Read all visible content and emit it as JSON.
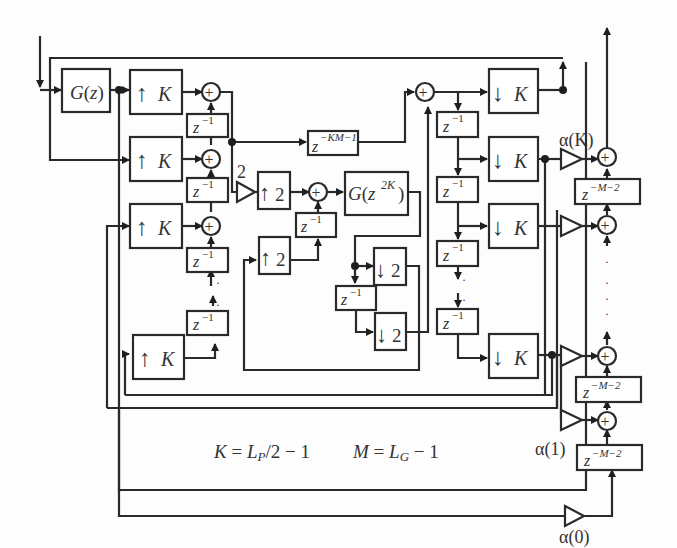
{
  "diagram": {
    "type": "signal-flow block diagram",
    "blocks": {
      "prefilter": {
        "label": "G(z)"
      },
      "upsampler_K": {
        "arrow": "↑",
        "factor": "K",
        "count_visible": 4
      },
      "delay": {
        "base": "z",
        "exp": "−1"
      },
      "long_delay": {
        "base": "z",
        "exp": "−KM−1"
      },
      "gain_two": {
        "label": "2"
      },
      "upsampler_2": {
        "arrow": "↑",
        "factor": "2",
        "count_visible": 2
      },
      "interp_filter": {
        "base": "G(z",
        "exp": "2K",
        "close": ")"
      },
      "downsampler_2": {
        "arrow": "↓",
        "factor": "2",
        "count_visible": 2
      },
      "downsampler_K": {
        "arrow": "↓",
        "factor": "K",
        "count_visible": 4
      },
      "output_delay": {
        "base": "z",
        "exp": "−M−2",
        "count_visible": 3
      },
      "adder_symbol": "+"
    },
    "coefficients": {
      "alpha_K": "α(K)",
      "alpha_1": "α(1)",
      "alpha_0": "α(0)"
    },
    "equations": {
      "K_def": {
        "lhs": "K",
        "eq": " = ",
        "rhs_var": "L",
        "rhs_sub": "P",
        "rhs_tail": "/2 − 1"
      },
      "M_def": {
        "lhs": "M",
        "eq": " = ",
        "rhs_var": "L",
        "rhs_sub": "G",
        "rhs_tail": " − 1"
      }
    },
    "continuation_dots": "·"
  }
}
